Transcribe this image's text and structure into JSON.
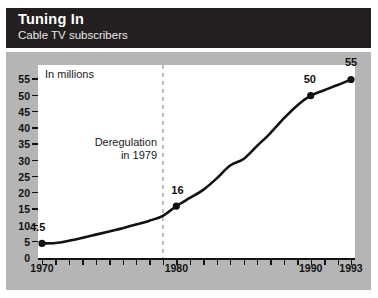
{
  "header": {
    "title": "Tuning In",
    "subtitle": "Cable TV subscribers"
  },
  "chart_data": {
    "type": "line",
    "title": "Tuning In",
    "subtitle": "Cable TV subscribers",
    "units_label": "In millions",
    "xlabel": "",
    "ylabel": "In millions",
    "xlim": [
      1970,
      1993
    ],
    "ylim": [
      0,
      57
    ],
    "grid": false,
    "legend": "none",
    "y_ticks": [
      55,
      50,
      45,
      40,
      35,
      30,
      25,
      20,
      15,
      10,
      5,
      0
    ],
    "x_tick_labels": [
      "1970",
      "1980",
      "1990",
      "1993"
    ],
    "x_tick_values": [
      1970,
      1980,
      1990,
      1993
    ],
    "x_minor_ticks": [
      1970,
      1971,
      1972,
      1973,
      1974,
      1975,
      1976,
      1977,
      1978,
      1979,
      1980,
      1981,
      1982,
      1983,
      1984,
      1985,
      1986,
      1987,
      1988,
      1989,
      1990,
      1991,
      1992,
      1993
    ],
    "x": [
      1970,
      1971,
      1972,
      1973,
      1974,
      1975,
      1976,
      1977,
      1978,
      1979,
      1980,
      1981,
      1982,
      1983,
      1984,
      1985,
      1986,
      1987,
      1988,
      1989,
      1990,
      1991,
      1992,
      1993
    ],
    "values": [
      4.5,
      4.6,
      5.3,
      6.2,
      7.2,
      8.2,
      9.2,
      10.3,
      11.5,
      13.0,
      16.0,
      18.5,
      21.0,
      24.5,
      28.5,
      30.5,
      34.5,
      38.5,
      43.0,
      47.0,
      50.0,
      51.7,
      53.3,
      55.0
    ],
    "series": [
      {
        "name": "Cable TV subscribers",
        "values": [
          4.5,
          4.6,
          5.3,
          6.2,
          7.2,
          8.2,
          9.2,
          10.3,
          11.5,
          13.0,
          16.0,
          18.5,
          21.0,
          24.5,
          28.5,
          30.5,
          34.5,
          38.5,
          43.0,
          47.0,
          50.0,
          51.7,
          53.3,
          55.0
        ]
      }
    ],
    "markers": [
      {
        "x": 1970,
        "y": 4.5,
        "label": "4.5"
      },
      {
        "x": 1980,
        "y": 16,
        "label": "16"
      },
      {
        "x": 1990,
        "y": 50,
        "label": "50"
      },
      {
        "x": 1993,
        "y": 55,
        "label": "55"
      }
    ],
    "annotations": [
      {
        "name": "deregulation",
        "line1": "Deregulation",
        "line2": "in 1979",
        "x": 1979,
        "style": "dashed-vertical-line"
      }
    ],
    "colors": {
      "header_background": "#231f20",
      "header_text": "#ffffff",
      "panel_background": "#b5b5b5",
      "plot_background": "#ffffff",
      "line": "#111111",
      "marker": "#111111",
      "annotation_line": "#9a9a9a"
    }
  }
}
